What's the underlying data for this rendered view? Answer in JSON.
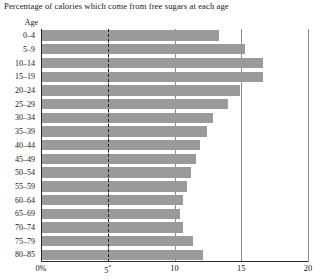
{
  "chart": {
    "title": "Percentage of calories which come from free sugars at each age",
    "axis_header": "Age"
  },
  "chart_data": {
    "type": "bar",
    "orientation": "horizontal",
    "title": "Percentage of calories which come from free sugars at each age",
    "xlabel": "",
    "ylabel": "Age",
    "xlim": [
      0,
      20
    ],
    "grid": true,
    "gridlines": [
      5,
      10,
      15,
      20
    ],
    "reference_line": {
      "value": 5,
      "style": "dashed",
      "label": "5*"
    },
    "xticks": [
      0,
      5,
      10,
      15,
      20
    ],
    "xticklabels": [
      "0%",
      "5*",
      "10",
      "15",
      "20"
    ],
    "bar_color": "#9a9a9a",
    "axis_color": "#2a2a2a",
    "grid_color": "#8d8d8d",
    "categories": [
      "0–4",
      "5–9",
      "10–14",
      "15–19",
      "20–24",
      "25–29",
      "30–34",
      "35–39",
      "40–44",
      "45–49",
      "50–54",
      "55–59",
      "60–64",
      "65–69",
      "70–74",
      "75–79",
      "80–85"
    ],
    "values": [
      13.3,
      15.3,
      16.6,
      16.6,
      14.9,
      14.0,
      12.9,
      12.4,
      11.9,
      11.6,
      11.2,
      10.9,
      10.6,
      10.4,
      10.6,
      11.4,
      12.1
    ]
  }
}
